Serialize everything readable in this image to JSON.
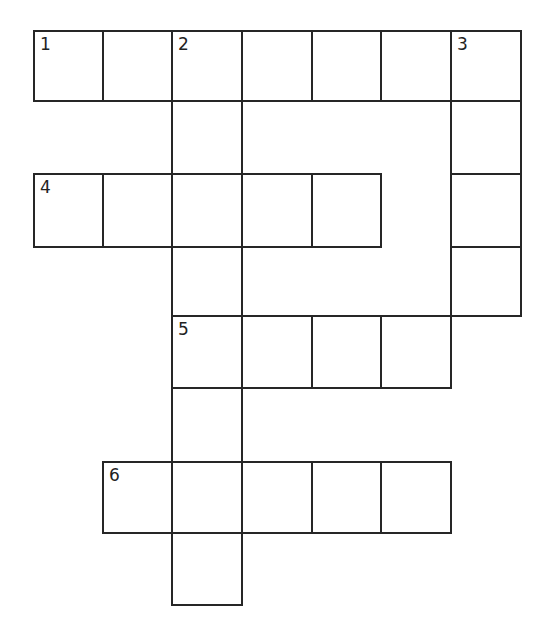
{
  "puzzle": {
    "type": "crossword",
    "colors": {
      "line": "#262626",
      "background": "#ffffff",
      "number": "#222222"
    },
    "col_x": [
      34,
      103,
      172,
      242,
      312,
      381,
      451,
      521
    ],
    "row_y": [
      31,
      101,
      174,
      247,
      316,
      388,
      462,
      533,
      605
    ],
    "cells": [
      {
        "r": 0,
        "c": 0,
        "num": "1"
      },
      {
        "r": 0,
        "c": 1
      },
      {
        "r": 0,
        "c": 2,
        "num": "2"
      },
      {
        "r": 0,
        "c": 3
      },
      {
        "r": 0,
        "c": 4
      },
      {
        "r": 0,
        "c": 5
      },
      {
        "r": 0,
        "c": 6,
        "num": "3"
      },
      {
        "r": 1,
        "c": 2
      },
      {
        "r": 1,
        "c": 6
      },
      {
        "r": 2,
        "c": 0,
        "num": "4"
      },
      {
        "r": 2,
        "c": 1
      },
      {
        "r": 2,
        "c": 2
      },
      {
        "r": 2,
        "c": 3
      },
      {
        "r": 2,
        "c": 4
      },
      {
        "r": 2,
        "c": 6
      },
      {
        "r": 3,
        "c": 2
      },
      {
        "r": 3,
        "c": 6
      },
      {
        "r": 4,
        "c": 2,
        "num": "5"
      },
      {
        "r": 4,
        "c": 3
      },
      {
        "r": 4,
        "c": 4
      },
      {
        "r": 4,
        "c": 5
      },
      {
        "r": 5,
        "c": 2
      },
      {
        "r": 6,
        "c": 1,
        "num": "6"
      },
      {
        "r": 6,
        "c": 2
      },
      {
        "r": 6,
        "c": 3
      },
      {
        "r": 6,
        "c": 4
      },
      {
        "r": 6,
        "c": 5
      },
      {
        "r": 7,
        "c": 2
      }
    ],
    "entries": [
      {
        "number": "1",
        "direction": "across",
        "length": 7
      },
      {
        "number": "2",
        "direction": "down",
        "length": 8
      },
      {
        "number": "3",
        "direction": "down",
        "length": 4
      },
      {
        "number": "4",
        "direction": "across",
        "length": 5
      },
      {
        "number": "5",
        "direction": "across",
        "length": 4
      },
      {
        "number": "6",
        "direction": "across",
        "length": 5
      }
    ]
  }
}
